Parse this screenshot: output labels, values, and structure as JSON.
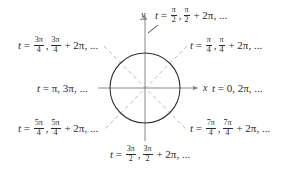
{
  "diagram": {
    "type": "unit-circle-parameter-diagram",
    "axes": {
      "x_label": "x",
      "y_label": "y"
    },
    "colors": {
      "circle": "#333333",
      "axes": "#888888",
      "dashed": "#bbbbbb",
      "text": "#2a2a2a"
    },
    "labels": {
      "top": {
        "var": "t",
        "eq": "=",
        "f1_num": "π",
        "f1_den": "2",
        "f2_num": "π",
        "f2_den": "2",
        "tail": "+ 2π, ..."
      },
      "top_right": {
        "var": "t",
        "eq": "=",
        "f1_num": "π",
        "f1_den": "4",
        "f2_num": "π",
        "f2_den": "4",
        "tail": "+ 2π, ..."
      },
      "top_left": {
        "var": "t",
        "eq": "=",
        "f1_num": "3π",
        "f1_den": "4",
        "f2_num": "3π",
        "f2_den": "4",
        "tail": "+ 2π, ..."
      },
      "left": {
        "var": "t",
        "eq": "=",
        "text": "π, 3π, ..."
      },
      "right": {
        "var": "t",
        "eq": "=",
        "text": "0, 2π, ..."
      },
      "bottom_left": {
        "var": "t",
        "eq": "=",
        "f1_num": "5π",
        "f1_den": "4",
        "f2_num": "5π",
        "f2_den": "4",
        "tail": "+ 2π, ..."
      },
      "bottom_right": {
        "var": "t",
        "eq": "=",
        "f1_num": "7π",
        "f1_den": "4",
        "f2_num": "7π",
        "f2_den": "4",
        "tail": "+ 2π, ..."
      },
      "bottom": {
        "var": "t",
        "eq": "=",
        "f1_num": "3π",
        "f1_den": "2",
        "f2_num": "3π",
        "f2_den": "2",
        "tail": "+ 2π, ..."
      }
    }
  }
}
